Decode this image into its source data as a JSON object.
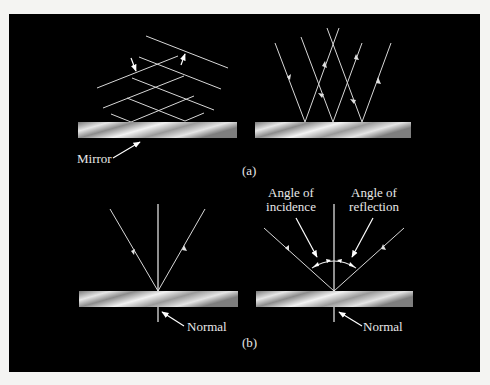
{
  "figure": {
    "background_color": "#000000",
    "line_color": "#d8d8d8",
    "mirror_gradient": [
      "#7a7a7a",
      "#e8e8e8",
      "#8a8a8a",
      "#f0f0f0",
      "#9a9a9a",
      "#e0e0e0",
      "#808080"
    ]
  },
  "panel_a": {
    "caption": "(a)",
    "left": {
      "mirror_label": "Mirror",
      "description": "wavefronts incident and reflected"
    },
    "right": {
      "description": "rays incident and reflected"
    }
  },
  "panel_b": {
    "caption": "(b)",
    "left": {
      "normal_label": "Normal"
    },
    "right": {
      "normal_label": "Normal",
      "incidence_label_line1": "Angle of",
      "incidence_label_line2": "incidence",
      "reflection_label_line1": "Angle of",
      "reflection_label_line2": "reflection"
    }
  }
}
